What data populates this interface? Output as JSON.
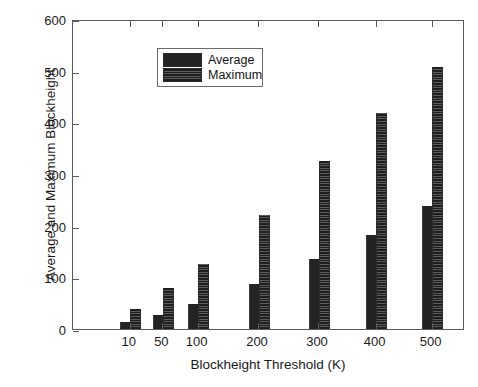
{
  "chart_data": {
    "type": "bar",
    "title": "",
    "xlabel": "Blockheight Threshold (K)",
    "ylabel": "Average and Maximum Blockheight",
    "categories": [
      "10",
      "50",
      "100",
      "200",
      "300",
      "400",
      "500"
    ],
    "series": [
      {
        "name": "Average",
        "values": [
          13,
          27,
          48,
          88,
          136,
          181,
          238
        ],
        "color": "#232323"
      },
      {
        "name": "Maximum",
        "values": [
          39,
          79,
          125,
          220,
          325,
          418,
          507
        ],
        "color": "#1e1e1e"
      }
    ],
    "ylim": [
      0,
      600
    ],
    "yticks": [
      0,
      100,
      200,
      300,
      400,
      500,
      600
    ],
    "ytick_labels": [
      "0",
      "100",
      "200",
      "300",
      "400",
      "500",
      "600"
    ],
    "grid": false,
    "legend_position": "top-left",
    "axis_color": "#5a5a5a",
    "background": "#ffffff"
  },
  "legend": {
    "entries": [
      {
        "label": "Average"
      },
      {
        "label": "Maximum"
      }
    ]
  },
  "axes": {
    "y_title": "Average and Maximum Blockheight",
    "x_title": "Blockheight Threshold (K)"
  }
}
